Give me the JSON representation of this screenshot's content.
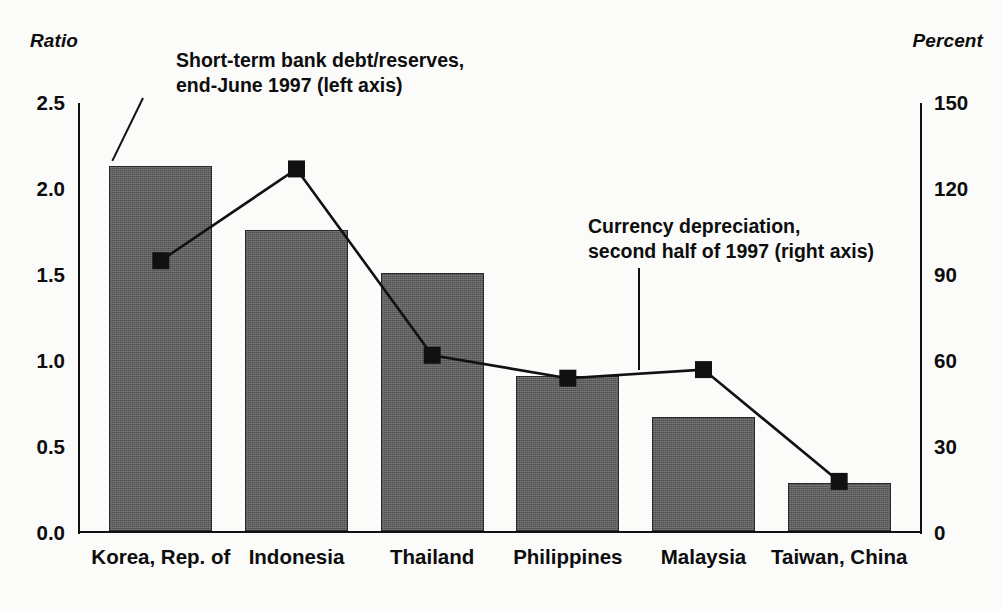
{
  "chart_data": {
    "type": "bar",
    "title": "",
    "subtitle": "",
    "categories": [
      "Korea, Rep. of",
      "Indonesia",
      "Thailand",
      "Philippines",
      "Malaysia",
      "Taiwan, China"
    ],
    "series": [
      {
        "name": "Short-term bank debt/reserves, end-June 1997 (left axis)",
        "type": "bar",
        "axis": "left",
        "unit": "Ratio",
        "values": [
          2.12,
          1.75,
          1.5,
          0.9,
          0.66,
          0.28
        ]
      },
      {
        "name": "Currency depreciation, second half of 1997 (right axis)",
        "type": "line",
        "axis": "right",
        "unit": "Percent",
        "values": [
          95,
          127,
          62,
          54,
          57,
          18
        ]
      }
    ],
    "left_axis": {
      "label": "Ratio",
      "ticks": [
        "0.0",
        "0.5",
        "1.0",
        "1.5",
        "2.0",
        "2.5"
      ],
      "tick_values": [
        0.0,
        0.5,
        1.0,
        1.5,
        2.0,
        2.5
      ],
      "min": 0.0,
      "max": 2.5
    },
    "right_axis": {
      "label": "Percent",
      "ticks": [
        "0",
        "30",
        "60",
        "90",
        "120",
        "150"
      ],
      "tick_values": [
        0,
        30,
        60,
        90,
        120,
        150
      ],
      "min": 0,
      "max": 150
    },
    "xlabel": "",
    "grid": false,
    "legend": "annotations",
    "annotations": [
      {
        "id": "bars",
        "lines": [
          "Short-term bank debt/reserves,",
          "end-June 1997 (left axis)"
        ],
        "text": "Short-term bank debt/reserves,\nend-June 1997 (left axis)"
      },
      {
        "id": "line",
        "lines": [
          "Currency depreciation,",
          "second half of 1997 (right axis)"
        ],
        "text": "Currency depreciation,\nsecond half of 1997 (right axis)"
      }
    ],
    "colors": {
      "bar_fill": "#5e5e5e",
      "bar_edge": "#2a2a2a",
      "line": "#111111",
      "marker": "#111111",
      "background": "#fbfbfa",
      "text": "#0d0d0d"
    }
  }
}
